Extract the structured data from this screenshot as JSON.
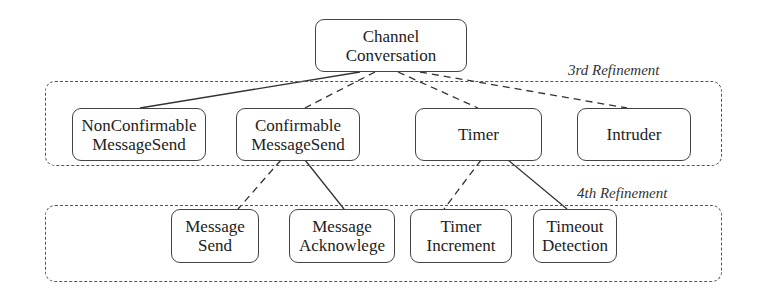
{
  "diagram": {
    "root": {
      "id": "channel-conversation",
      "label": "Channel\nConversation"
    },
    "levels": [
      {
        "label": "3rd Refinement",
        "nodes": [
          {
            "id": "nonconfirmable-messagesend",
            "label": "NonConfirmable\nMessageSend"
          },
          {
            "id": "confirmable-messagesend",
            "label": "Confirmable\nMessageSend"
          },
          {
            "id": "timer",
            "label": "Timer"
          },
          {
            "id": "intruder",
            "label": "Intruder"
          }
        ]
      },
      {
        "label": "4th Refinement",
        "nodes": [
          {
            "id": "message-send",
            "label": "Message\nSend"
          },
          {
            "id": "message-acknowlege",
            "label": "Message\nAcknowlege"
          },
          {
            "id": "timer-increment",
            "label": "Timer\nIncrement"
          },
          {
            "id": "timeout-detection",
            "label": "Timeout\nDetection"
          }
        ]
      }
    ],
    "edges": [
      {
        "from": "channel-conversation",
        "to": "nonconfirmable-messagesend",
        "style": "solid"
      },
      {
        "from": "channel-conversation",
        "to": "confirmable-messagesend",
        "style": "dashed"
      },
      {
        "from": "channel-conversation",
        "to": "timer",
        "style": "dashed"
      },
      {
        "from": "channel-conversation",
        "to": "intruder",
        "style": "dashed"
      },
      {
        "from": "confirmable-messagesend",
        "to": "message-send",
        "style": "dashed"
      },
      {
        "from": "confirmable-messagesend",
        "to": "message-acknowlege",
        "style": "solid"
      },
      {
        "from": "timer",
        "to": "timer-increment",
        "style": "dashed"
      },
      {
        "from": "timer",
        "to": "timeout-detection",
        "style": "solid"
      }
    ]
  }
}
